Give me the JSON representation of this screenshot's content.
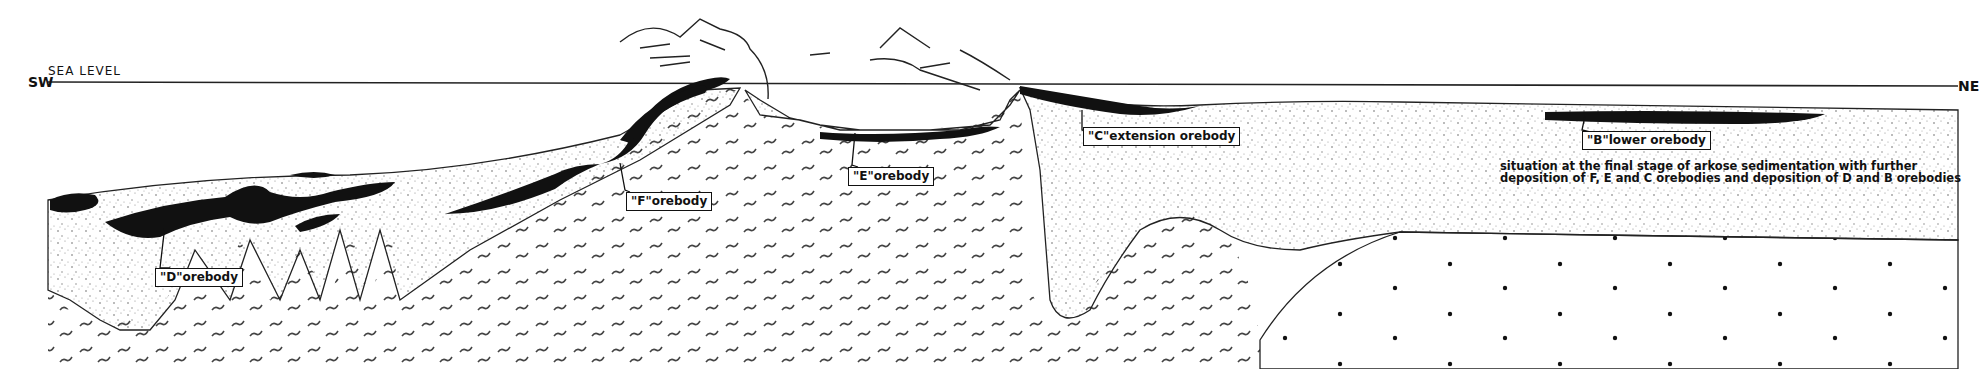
{
  "diagram": {
    "orientation": {
      "left": "SW",
      "right": "NE",
      "reference_line": "SEA LEVEL"
    },
    "orebody_labels": [
      {
        "id": "D",
        "label": "\"D\"orebody"
      },
      {
        "id": "F",
        "label": "\"F\"orebody"
      },
      {
        "id": "E",
        "label": "\"E\"orebody"
      },
      {
        "id": "C",
        "label": "\"C\"extension orebody"
      },
      {
        "id": "B",
        "label": "\"B\"lower orebody"
      }
    ],
    "caption": "situation at the final stage of arkose sedimentation with further deposition of F, E and C orebodies and deposition of D and B orebodies",
    "colors": {
      "ink": "#111111",
      "background": "#ffffff",
      "stipple": "#555555"
    }
  }
}
